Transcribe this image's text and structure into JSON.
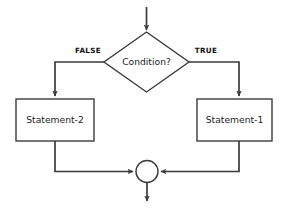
{
  "diagram": {
    "background_color": "#fefefe",
    "line_color": "#3b3b3b",
    "text_color": "#1c1c1c",
    "decision": {
      "label": "Condition?",
      "shape": "diamond"
    },
    "branches": {
      "false_label": "FALSE",
      "true_label": "TRUE"
    },
    "process_left": {
      "label": "Statement-2",
      "shape": "rectangle"
    },
    "process_right": {
      "label": "Statement-1",
      "shape": "rectangle"
    },
    "merge": {
      "label": "",
      "shape": "circle"
    }
  }
}
